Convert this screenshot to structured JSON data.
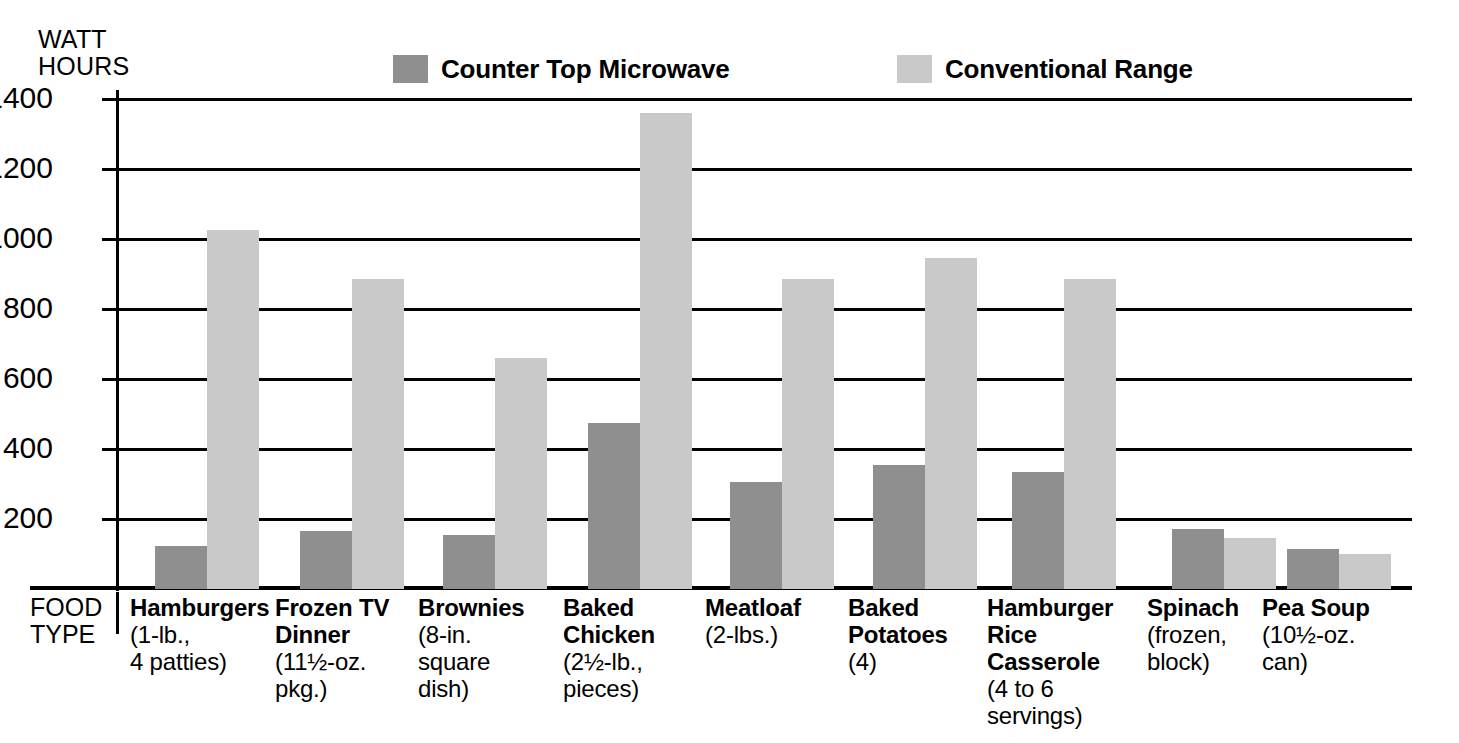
{
  "chart_data": {
    "type": "bar",
    "title": "",
    "ylabel": "WATT HOURS",
    "xlabel": "FOOD TYPE",
    "ylim": [
      0,
      1400
    ],
    "yticks": [
      200,
      400,
      600,
      800,
      1000,
      1200,
      1400
    ],
    "ytick_labels": [
      "200",
      "400",
      "600",
      "800",
      "1000",
      "1200",
      "1400"
    ],
    "grid": true,
    "legend_position": "top",
    "categories": [
      "Hamburgers",
      "Frozen TV Dinner",
      "Brownies",
      "Baked Chicken",
      "Meatloaf",
      "Baked Potatoes",
      "Hamburger Rice Casserole",
      "Spinach",
      "Pea Soup"
    ],
    "category_sublabels": [
      "(1-lb.,\n4 patties)",
      "(11½-oz.\npkg.)",
      "(8-in.\nsquare\ndish)",
      "(2½-lb.,\npieces)",
      "(2-lbs.)",
      "(4)",
      "(4 to 6\nservings)",
      "(frozen,\nblock)",
      "(10½-oz.\ncan)"
    ],
    "series": [
      {
        "name": "Counter Top Microwave",
        "color": "#8f8f8f",
        "values": [
          122,
          165,
          155,
          475,
          305,
          355,
          335,
          172,
          115
        ]
      },
      {
        "name": "Conventional Range",
        "color": "#c9c9c9",
        "values": [
          1025,
          885,
          660,
          1360,
          885,
          945,
          885,
          147,
          100
        ]
      }
    ]
  },
  "axis": {
    "y_title": "WATT\nHOURS",
    "x_title": "FOOD\nTYPE"
  },
  "legend": {
    "items": [
      {
        "label": "Counter Top Microwave",
        "color": "#8f8f8f"
      },
      {
        "label": "Conventional Range",
        "color": "#c9c9c9"
      }
    ]
  },
  "colors": {
    "microwave": "#8f8f8f",
    "conventional": "#c9c9c9",
    "axis": "#000000",
    "background": "#ffffff"
  }
}
